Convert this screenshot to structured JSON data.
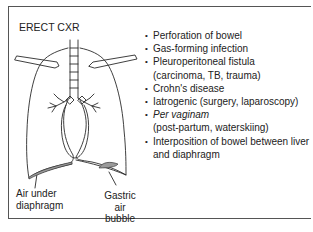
{
  "figure": {
    "title": "ERECT CXR",
    "labels": {
      "air_under_diaphragm": [
        "Air under",
        "diaphragm"
      ],
      "gastric_air_bubble": [
        "Gastric",
        "air",
        "bubble"
      ]
    },
    "causes": [
      {
        "text": "Perforation of bowel",
        "sub": ""
      },
      {
        "text": "Gas-forming infection",
        "sub": ""
      },
      {
        "text": "Pleuroperitoneal fistula",
        "sub": "(carcinoma, TB, trauma)"
      },
      {
        "text": "Crohn's disease",
        "sub": ""
      },
      {
        "text": "Iatrogenic (surgery, laparoscopy)",
        "sub": ""
      },
      {
        "text": "Per vaginam",
        "sub": "(post-partum, waterskiing)"
      },
      {
        "text": "Interposition of bowel between liver",
        "sub": "and diaphragm"
      }
    ],
    "bullet": "•",
    "colors": {
      "line": "#2a2a2a",
      "air_fill": "#9a9a9a",
      "frame": "#555555"
    }
  }
}
